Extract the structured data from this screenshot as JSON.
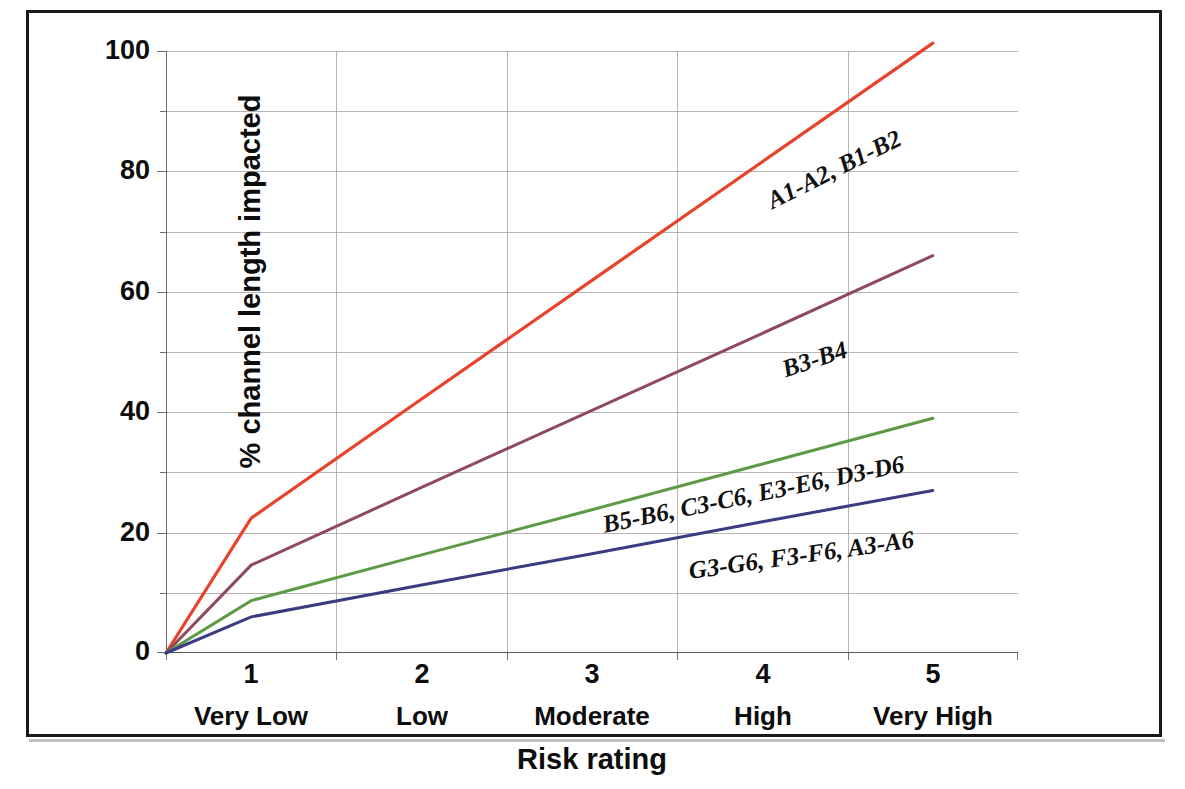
{
  "chart_data": {
    "type": "line",
    "title": "",
    "xlabel": "Risk rating",
    "ylabel": "% channel length impacted",
    "x": [
      1,
      2,
      3,
      4,
      5
    ],
    "categories": [
      "1",
      "2",
      "3",
      "4",
      "5"
    ],
    "category_sublabels": [
      "Very Low",
      "Low",
      "Moderate",
      "High",
      "Very High"
    ],
    "xlim": [
      0.5,
      5.5
    ],
    "ylim": [
      0,
      100
    ],
    "ytick_labels": [
      "0",
      "20",
      "40",
      "60",
      "80",
      "100"
    ],
    "ytick_values": [
      0,
      20,
      40,
      60,
      80,
      100
    ],
    "yminor_values": [
      10,
      30,
      50,
      70,
      90
    ],
    "grid": "horizontal-and-vertical",
    "legend": "inline-labels-on-lines",
    "series": [
      {
        "name": "A1-A2, B1-B2",
        "color": "#E8432A",
        "values": [
          22.4,
          42.2,
          61.9,
          81.6,
          101.3
        ],
        "label_angle": -26.5
      },
      {
        "name": "B3-B4",
        "color": "#8E4A5E",
        "values": [
          14.6,
          27.5,
          40.3,
          53.1,
          66.0
        ],
        "label_angle": -18.5
      },
      {
        "name": "B5-B6, C3-C6, E3-E6, D3-D6",
        "color": "#5C9A46",
        "values": [
          8.7,
          16.3,
          23.8,
          31.4,
          39.0
        ],
        "label_angle": -11.5
      },
      {
        "name": "G3-G6, F3-F6, A3-A6",
        "color": "#3B3B82",
        "values": [
          6.0,
          11.3,
          16.5,
          21.8,
          27.0
        ],
        "label_angle": -8.0
      }
    ],
    "annotations": [
      {
        "text": "A1-A2, B1-B2",
        "series": "A1-A2, B1-B2"
      },
      {
        "text": "B3-B4",
        "series": "B3-B4"
      },
      {
        "text": "B5-B6, C3-C6, E3-E6, D3-D6",
        "series": "B5-B6, C3-C6, E3-E6, D3-D6"
      },
      {
        "text": "G3-G6, F3-F6, A3-A6",
        "series": "G3-G6, F3-F6, A3-A6"
      }
    ]
  },
  "axes": {
    "y_title": "% channel length impacted",
    "x_title": "Risk rating",
    "y_labels": [
      "100",
      "80",
      "60",
      "40",
      "20",
      "0"
    ],
    "x_numbers": [
      "1",
      "2",
      "3",
      "4",
      "5"
    ],
    "x_categories": [
      "Very Low",
      "Low",
      "Moderate",
      "High",
      "Very High"
    ]
  },
  "series_labels": {
    "red": "A1-A2, B1-B2",
    "maroon": "B3-B4",
    "green": "B5-B6, C3-C6, E3-E6, D3-D6",
    "navy": "G3-G6, F3-F6, A3-A6"
  },
  "colors": {
    "red": "#E8432A",
    "maroon": "#8E4A5E",
    "green": "#5C9A46",
    "navy": "#3B3B82",
    "grid": "#9c9c9c",
    "frame": "#1a1a1a",
    "text": "#0d0d0d"
  }
}
